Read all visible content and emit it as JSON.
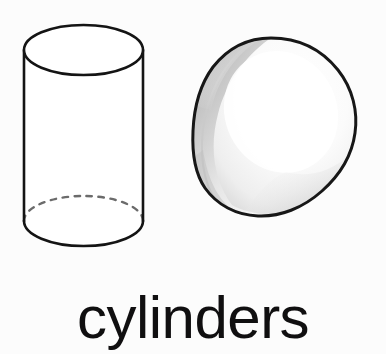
{
  "canvas": {
    "width": 386,
    "height": 354,
    "background_color": "#fcfcfc"
  },
  "caption": {
    "text": "cylinders",
    "color": "#100f10",
    "align": "center"
  },
  "figures": [
    {
      "id": "upright-cylinder",
      "name": "wireframe-cylinder",
      "label": "upright cylinder, wireframe outline",
      "style": "outline",
      "stroke_color": "#141414",
      "fill_color": "#ffffff",
      "hidden_edge_style": "dashed",
      "hidden_edge_color": "#6e6e6e",
      "bounds": {
        "x": 24,
        "y": 25,
        "width": 119,
        "height": 221
      },
      "top_ellipse": {
        "cx": 83.5,
        "cy": 50,
        "rx": 59.5,
        "ry": 25
      },
      "bottom_ellipse": {
        "cx": 83.5,
        "cy": 221,
        "rx": 59.5,
        "ry": 25
      }
    },
    {
      "id": "tilted-cylinder",
      "name": "shaded-tilted-cylinder",
      "label": "tilted cylinder viewed end-on, shaded",
      "style": "shaded",
      "stroke_color": "#171717",
      "highlight_color": "#fbfbfb",
      "midtone_color": "#dcdcdc",
      "shadow_color": "#a8a8a8",
      "bounds": {
        "x": 192,
        "y": 37,
        "width": 164,
        "height": 180
      }
    }
  ]
}
